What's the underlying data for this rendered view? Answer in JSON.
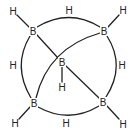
{
  "diagram": {
    "type": "molecular-structure",
    "colors": {
      "stroke": "#222222",
      "background": "#ffffff"
    },
    "atoms": {
      "b_top_left": {
        "symbol": "B",
        "x": 33,
        "y": 31
      },
      "b_top_right": {
        "symbol": "B",
        "x": 104,
        "y": 31
      },
      "b_center": {
        "symbol": "B",
        "x": 62,
        "y": 62
      },
      "b_bottom_left": {
        "symbol": "B",
        "x": 34,
        "y": 103
      },
      "b_bottom_right": {
        "symbol": "B",
        "x": 103,
        "y": 102
      },
      "h_top_left": {
        "symbol": "H",
        "x": 13,
        "y": 11
      },
      "h_top": {
        "symbol": "H",
        "x": 69,
        "y": 10
      },
      "h_top_right": {
        "symbol": "H",
        "x": 123,
        "y": 10
      },
      "h_left": {
        "symbol": "H",
        "x": 13,
        "y": 65
      },
      "h_right": {
        "symbol": "H",
        "x": 122,
        "y": 65
      },
      "h_center": {
        "symbol": "H",
        "x": 62,
        "y": 87
      },
      "h_bottom_left": {
        "symbol": "H",
        "x": 15,
        "y": 123
      },
      "h_bottom": {
        "symbol": "H",
        "x": 66,
        "y": 123
      },
      "h_bottom_right": {
        "symbol": "H",
        "x": 123,
        "y": 124
      }
    }
  }
}
